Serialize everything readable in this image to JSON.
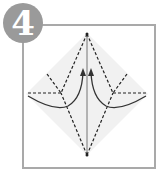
{
  "step": {
    "number": "4",
    "badge_color": "#9a9a9a",
    "frame_color": "#a9a9a9"
  },
  "diagram": {
    "paper_fill": "#f2f2f2",
    "line_color": "#333333",
    "arrows": [
      "left-flap-arrow",
      "right-flap-arrow"
    ]
  }
}
